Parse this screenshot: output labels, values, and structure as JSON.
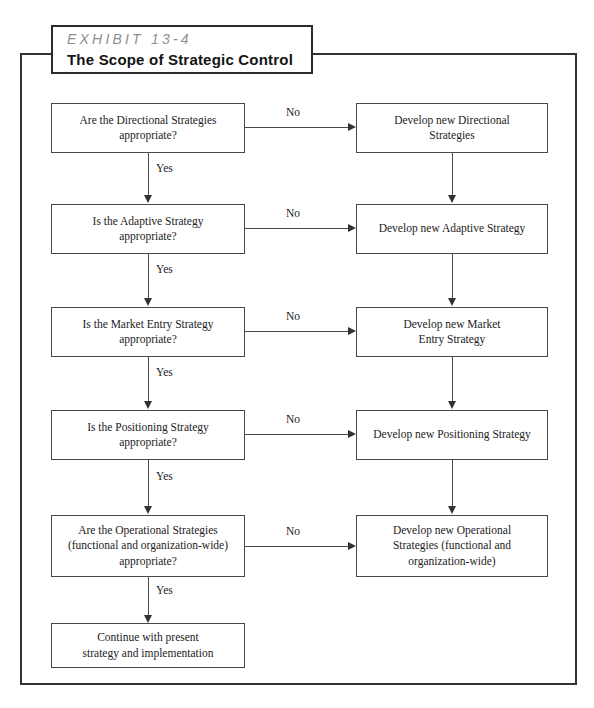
{
  "exhibit": {
    "number_label": "EXHIBIT 13-4",
    "title": "The Scope of Strategic Control"
  },
  "labels": {
    "yes": "Yes",
    "no": "No"
  },
  "rows": [
    {
      "id": "directional",
      "decision_line1": "Are the Directional Strategies",
      "decision_line2": "appropriate?",
      "decision_line3": "",
      "action_line1": "Develop new Directional",
      "action_line2": "Strategies",
      "action_line3": "",
      "no_label": "No",
      "yes_label": "Yes"
    },
    {
      "id": "adaptive",
      "decision_line1": "Is the Adaptive Strategy",
      "decision_line2": "appropriate?",
      "decision_line3": "",
      "action_line1": "Develop new Adaptive Strategy",
      "action_line2": "",
      "action_line3": "",
      "no_label": "No",
      "yes_label": "Yes"
    },
    {
      "id": "market-entry",
      "decision_line1": "Is the Market Entry Strategy",
      "decision_line2": "appropriate?",
      "decision_line3": "",
      "action_line1": "Develop new Market",
      "action_line2": "Entry Strategy",
      "action_line3": "",
      "no_label": "No",
      "yes_label": "Yes"
    },
    {
      "id": "positioning",
      "decision_line1": "Is the Positioning Strategy",
      "decision_line2": "appropriate?",
      "decision_line3": "",
      "action_line1": "Develop new Positioning Strategy",
      "action_line2": "",
      "action_line3": "",
      "no_label": "No",
      "yes_label": "Yes"
    },
    {
      "id": "operational",
      "decision_line1": "Are the Operational Strategies",
      "decision_line2": "(functional and organization-wide)",
      "decision_line3": "appropriate?",
      "action_line1": "Develop new Operational",
      "action_line2": "Strategies (functional and",
      "action_line3": "organization-wide)",
      "no_label": "No",
      "yes_label": "Yes"
    }
  ],
  "terminal": {
    "line1": "Continue with present",
    "line2": "strategy and implementation"
  },
  "colors": {
    "frame": "#333333",
    "box_border": "#4a4a4a",
    "text": "#1c1c1c",
    "exhibit_number": "#8e8e8e",
    "background": "#ffffff"
  }
}
